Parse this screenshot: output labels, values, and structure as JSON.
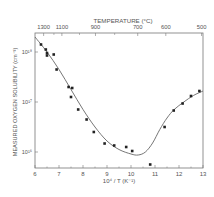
{
  "chart_data": {
    "type": "scatter",
    "title": "",
    "top_axis": {
      "label": "TEMPERATURE (°C)",
      "tick_labels": [
        "1300",
        "1100",
        "900",
        "700",
        "600",
        "500"
      ],
      "tick_positions_x": [
        6.36,
        7.12,
        8.52,
        10.28,
        11.45,
        12.94
      ]
    },
    "xlabel": "10⁴ / T (K⁻¹)",
    "ylabel": "MEASURED OXYGEN SOLUBILITY (cm⁻³)",
    "xlim": [
      6,
      13
    ],
    "ylim_log10": [
      15.68,
      18.38
    ],
    "x_ticks": [
      "6",
      "7",
      "8",
      "9",
      "10",
      "11",
      "12",
      "13"
    ],
    "y_ticks": [
      {
        "label": "10¹⁸",
        "log10": 18
      },
      {
        "label": "10¹⁷",
        "log10": 17
      },
      {
        "label": "10¹⁶",
        "log10": 16
      }
    ],
    "points": [
      {
        "x": 6.25,
        "log10y": 18.15
      },
      {
        "x": 6.45,
        "log10y": 18.05
      },
      {
        "x": 6.5,
        "log10y": 17.98
      },
      {
        "x": 6.5,
        "log10y": 17.93
      },
      {
        "x": 6.78,
        "log10y": 17.95
      },
      {
        "x": 6.9,
        "log10y": 17.65
      },
      {
        "x": 7.4,
        "log10y": 17.3
      },
      {
        "x": 7.55,
        "log10y": 17.28
      },
      {
        "x": 7.5,
        "log10y": 17.1
      },
      {
        "x": 7.8,
        "log10y": 16.85
      },
      {
        "x": 8.15,
        "log10y": 16.65
      },
      {
        "x": 8.45,
        "log10y": 16.4
      },
      {
        "x": 8.9,
        "log10y": 16.17
      },
      {
        "x": 9.3,
        "log10y": 16.13
      },
      {
        "x": 9.8,
        "log10y": 16.1
      },
      {
        "x": 10.05,
        "log10y": 16.02
      },
      {
        "x": 10.8,
        "log10y": 15.75
      },
      {
        "x": 11.4,
        "log10y": 16.5
      },
      {
        "x": 11.78,
        "log10y": 16.83
      },
      {
        "x": 12.15,
        "log10y": 16.97
      },
      {
        "x": 12.5,
        "log10y": 17.12
      },
      {
        "x": 12.85,
        "log10y": 17.22
      }
    ],
    "fit_curve": [
      {
        "x": 6.0,
        "log10y": 18.3
      },
      {
        "x": 6.5,
        "log10y": 18.0
      },
      {
        "x": 7.0,
        "log10y": 17.65
      },
      {
        "x": 7.5,
        "log10y": 17.25
      },
      {
        "x": 8.0,
        "log10y": 16.85
      },
      {
        "x": 8.5,
        "log10y": 16.5
      },
      {
        "x": 9.0,
        "log10y": 16.22
      },
      {
        "x": 9.5,
        "log10y": 16.05
      },
      {
        "x": 10.0,
        "log10y": 15.96
      },
      {
        "x": 10.3,
        "log10y": 15.94
      },
      {
        "x": 10.6,
        "log10y": 16.0
      },
      {
        "x": 10.9,
        "log10y": 16.18
      },
      {
        "x": 11.2,
        "log10y": 16.45
      },
      {
        "x": 11.5,
        "log10y": 16.68
      },
      {
        "x": 11.8,
        "log10y": 16.85
      },
      {
        "x": 12.2,
        "log10y": 17.0
      },
      {
        "x": 12.6,
        "log10y": 17.13
      },
      {
        "x": 13.0,
        "log10y": 17.22
      }
    ],
    "grid": false,
    "legend": null
  },
  "colors": {
    "axis": "#777777",
    "points": "#222222",
    "curve": "#666666",
    "text": "#555555"
  }
}
